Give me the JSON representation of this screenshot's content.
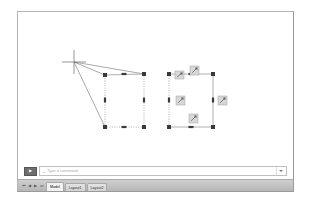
{
  "window": {
    "title": "CAD Drawing Editor",
    "frame_color": "#b4b4b4",
    "canvas_background": "#ffffff"
  },
  "command_bar": {
    "prompt_button_label": "▶",
    "prompt_icon": "command-prompt-icon",
    "caret_symbol": "⌄",
    "input_value": "",
    "placeholder": "Type a command",
    "dropdown_icon": "chevron-down-icon"
  },
  "status_strip": {
    "nav_buttons": [
      {
        "name": "layout-first-button",
        "glyph": "⏮"
      },
      {
        "name": "layout-prev-button",
        "glyph": "◀"
      },
      {
        "name": "layout-next-button",
        "glyph": "▶"
      },
      {
        "name": "layout-last-button",
        "glyph": "⏭"
      }
    ],
    "tabs": [
      {
        "label": "Model",
        "active": true
      },
      {
        "label": "Layout1",
        "active": false
      },
      {
        "label": "Layout2",
        "active": false
      }
    ]
  },
  "drawing": {
    "cursor": {
      "name": "crosshair-cursor",
      "x": 73,
      "y": 61,
      "arm": 12,
      "color": "#7c7c7c"
    },
    "selection_rays": {
      "color": "#6f6f6f",
      "from_x": 73,
      "from_y": 61,
      "to": [
        {
          "x": 104,
          "y": 74
        },
        {
          "x": 143,
          "y": 73
        },
        {
          "x": 104,
          "y": 126
        }
      ]
    },
    "shapes": [
      {
        "name": "selected-quad-left",
        "edge_color": "#8c8c8c",
        "edge_style_top": "solid",
        "edge_style_left": "dotted",
        "edge_style_right": "dotted",
        "edge_style_bottom": "dotted",
        "corners": [
          {
            "x": 104,
            "y": 74
          },
          {
            "x": 143,
            "y": 73
          },
          {
            "x": 143,
            "y": 126
          },
          {
            "x": 104,
            "y": 126
          }
        ],
        "grip_color": "#3a3a3a",
        "grip_size": 4,
        "mid_grips": [
          {
            "x": 123,
            "y": 73,
            "orient": "h"
          },
          {
            "x": 143,
            "y": 99,
            "orient": "v"
          },
          {
            "x": 123,
            "y": 126,
            "orient": "h"
          },
          {
            "x": 104,
            "y": 99,
            "orient": "v"
          }
        ]
      },
      {
        "name": "selected-rect-right",
        "edge_color": "#8c8c8c",
        "edge_style_top": "solid",
        "edge_style_left": "dotted",
        "edge_style_right": "solid",
        "edge_style_bottom": "solid",
        "corners": [
          {
            "x": 168,
            "y": 73
          },
          {
            "x": 212,
            "y": 73
          },
          {
            "x": 212,
            "y": 126
          },
          {
            "x": 168,
            "y": 126
          }
        ],
        "grip_color": "#3a3a3a",
        "grip_size": 4,
        "mid_grips": [
          {
            "x": 190,
            "y": 73,
            "orient": "h"
          },
          {
            "x": 212,
            "y": 99,
            "orient": "v"
          },
          {
            "x": 190,
            "y": 126,
            "orient": "h"
          },
          {
            "x": 168,
            "y": 99,
            "orient": "v"
          }
        ]
      }
    ],
    "grip_tooltips": [
      {
        "name": "grip-edit-icon-top",
        "x": 189,
        "y": 65,
        "w": 9,
        "h": 9
      },
      {
        "name": "grip-edit-icon-topleft",
        "x": 174,
        "y": 70,
        "w": 9,
        "h": 8
      },
      {
        "name": "grip-edit-icon-left",
        "x": 175,
        "y": 95,
        "w": 9,
        "h": 9
      },
      {
        "name": "grip-edit-icon-right",
        "x": 217,
        "y": 95,
        "w": 9,
        "h": 9
      },
      {
        "name": "grip-edit-icon-bottom",
        "x": 188,
        "y": 113,
        "w": 9,
        "h": 9
      }
    ],
    "tooltip_style": {
      "fill": "#d7d7d7",
      "stroke": "#9f9f9f",
      "glyph_color": "#6a6a6a"
    }
  }
}
